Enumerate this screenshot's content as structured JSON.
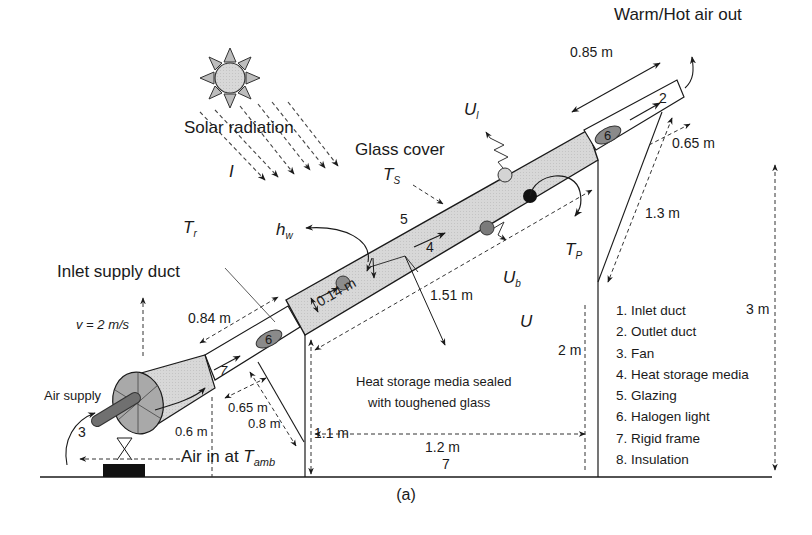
{
  "figure": {
    "caption": "(a)",
    "title_labels": {
      "warm_air_out": "Warm/Hot air out",
      "solar_radiation": "Solar radiation",
      "irradiance_symbol": "I",
      "glass_cover": "Glass cover",
      "ts_main": "T",
      "ts_sub": "S",
      "tr_main": "T",
      "tr_sub": "r",
      "hw_main": "h",
      "hw_sub": "w",
      "ul_main": "U",
      "ul_sub": "l",
      "ub_main": "U",
      "ub_sub": "b",
      "tp_main": "T",
      "tp_sub": "P",
      "u_overall": "U",
      "inlet_supply_duct": "Inlet supply duct",
      "velocity": "v = 2 m/s",
      "air_supply": "Air supply",
      "air_in_prefix": "Air in at ",
      "tamb_main": "T",
      "tamb_sub": "amb",
      "heat_storage_note_line1": "Heat storage media sealed",
      "heat_storage_note_line2": "with toughened glass"
    },
    "component_numbers": {
      "outlet": "2",
      "fan": "3",
      "storage": "4",
      "glazing": "5",
      "halogen_top": "6",
      "halogen_bottom": "6",
      "frame_inlet": "7",
      "frame_bottom": "7"
    },
    "dimensions": {
      "outlet_length": "0.85 m",
      "outlet_offset": "0.65 m",
      "rear_support": "1.3 m",
      "inlet_length": "0.84 m",
      "collector_thickness": "0.14 m",
      "collector_length": "1.51 m",
      "inlet_offset": "0.65 m",
      "inlet_support": "0.8 m",
      "fan_height": "0.6 m",
      "front_height": "1.1 m",
      "base_width": "1.2 m",
      "mid_height": "2 m",
      "total_height": "3 m"
    },
    "legend": {
      "items": [
        "1. Inlet duct",
        "2. Outlet duct",
        "3. Fan",
        "4. Heat storage media",
        "5. Glazing",
        "6. Halogen light",
        "7. Rigid frame",
        "8. Insulation"
      ]
    },
    "colors": {
      "collector_fill": "#d6d6d6",
      "fan_fill": "#bdbdbd",
      "halogen_fill": "#8a8a8a",
      "line": "#1a1a1a"
    }
  }
}
